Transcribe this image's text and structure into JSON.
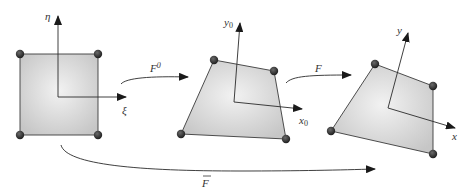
{
  "figure": {
    "colors": {
      "element_fill_center": "#f2f2f2",
      "element_fill_edge": "#c8c8c8",
      "node": "#2b2b2b",
      "line": "#2a2a2a"
    }
  },
  "elements": [
    {
      "name": "parent-element",
      "nodes": [
        [
          20,
          54
        ],
        [
          98,
          54
        ],
        [
          98,
          135
        ],
        [
          20,
          135
        ]
      ],
      "axes": {
        "origin": [
          58,
          97
        ],
        "horizontal": {
          "tip": [
            126,
            97
          ],
          "label": "ξ",
          "label_pos": [
            124,
            113
          ]
        },
        "vertical": {
          "tip": [
            58,
            16
          ],
          "label": "η",
          "label_pos": [
            48,
            20
          ]
        }
      }
    },
    {
      "name": "reference-element",
      "nodes": [
        [
          214,
          60
        ],
        [
          274,
          71
        ],
        [
          286,
          139
        ],
        [
          181,
          134
        ]
      ],
      "axes": {
        "origin": [
          234,
          102
        ],
        "horizontal": {
          "tip": [
            302,
            109
          ],
          "label": "x",
          "subscript": "0",
          "label_pos": [
            302,
            124
          ]
        },
        "vertical": {
          "tip": [
            240,
            23
          ],
          "label": "y",
          "subscript": "0",
          "label_pos": [
            225,
            28
          ]
        }
      }
    },
    {
      "name": "current-element",
      "nodes": [
        [
          375,
          64
        ],
        [
          433,
          86
        ],
        [
          433,
          154
        ],
        [
          331,
          131
        ]
      ],
      "axes": {
        "origin": [
          388,
          108
        ],
        "horizontal": {
          "tip": [
            455,
            128
          ],
          "label": "x",
          "label_pos": [
            455,
            143
          ]
        },
        "vertical": {
          "tip": [
            408,
            33
          ],
          "label": "y",
          "label_pos": [
            398,
            32
          ]
        }
      }
    }
  ],
  "mappings": [
    {
      "name": "F0",
      "label": "F",
      "superscript": "0",
      "label_pos": [
        154,
        73
      ]
    },
    {
      "name": "F",
      "label": "F",
      "label_pos": [
        316,
        72
      ]
    },
    {
      "name": "F-bar",
      "label": "F",
      "overbar": true,
      "label_pos": [
        203,
        184
      ]
    }
  ]
}
